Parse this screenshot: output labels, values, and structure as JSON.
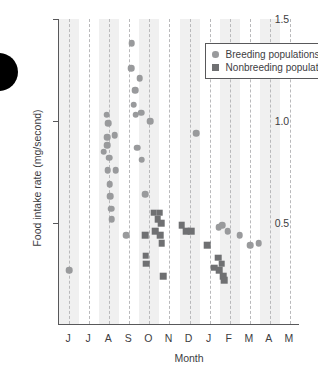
{
  "panel": {
    "marker_shape": "filled-circle",
    "marker_color": "#000000"
  },
  "legend": {
    "entries": [
      {
        "label": "Breeding populations",
        "marker": "circle",
        "color": "#999a9c"
      },
      {
        "label": "Nonbreeding populations",
        "marker": "square",
        "color": "#6f7072"
      }
    ]
  },
  "chart_data": {
    "type": "scatter",
    "title": "",
    "xlabel": "Month",
    "ylabel": "Food intake rate (mg/second)",
    "xlim": [
      0,
      12
    ],
    "ylim": [
      0.0,
      1.5
    ],
    "yticks": [
      0.5,
      1.0,
      1.5
    ],
    "ytick_labels": [
      "0.5",
      "1.0",
      "1.5"
    ],
    "xtick_labels": [
      "J",
      "J",
      "A",
      "S",
      "O",
      "N",
      "D",
      "J",
      "F",
      "M",
      "A",
      "M"
    ],
    "xtick_positions": [
      0.5,
      1.5,
      2.5,
      3.5,
      4.5,
      5.5,
      6.5,
      7.5,
      8.5,
      9.5,
      10.5,
      11.5
    ],
    "grid": "vertical-dashed-at-month-centers",
    "shaded_bands": [
      [
        0.0,
        1.0
      ],
      [
        2.0,
        3.0
      ],
      [
        4.0,
        5.0
      ],
      [
        6.0,
        7.0
      ],
      [
        8.0,
        9.0
      ],
      [
        10.0,
        11.0
      ]
    ],
    "legend_position": "top-right-inside",
    "series": [
      {
        "name": "Breeding populations",
        "marker": "circle",
        "color": "#999a9c",
        "points": [
          [
            0.5,
            0.27
          ],
          [
            2.22,
            0.85
          ],
          [
            2.38,
            1.03
          ],
          [
            2.4,
            0.92
          ],
          [
            2.4,
            0.88
          ],
          [
            2.42,
            0.76
          ],
          [
            2.45,
            0.99
          ],
          [
            2.5,
            0.82
          ],
          [
            2.52,
            0.69
          ],
          [
            2.55,
            0.63
          ],
          [
            2.6,
            0.57
          ],
          [
            2.62,
            0.52
          ],
          [
            2.78,
            0.93
          ],
          [
            2.82,
            0.76
          ],
          [
            3.35,
            0.44
          ],
          [
            3.62,
            1.38
          ],
          [
            3.6,
            1.26
          ],
          [
            3.72,
            1.08
          ],
          [
            3.78,
            1.15
          ],
          [
            3.82,
            1.03
          ],
          [
            3.88,
            0.87
          ],
          [
            4.02,
            1.21
          ],
          [
            4.08,
            1.04
          ],
          [
            4.12,
            0.81
          ],
          [
            4.3,
            0.64
          ],
          [
            4.55,
            1.0
          ],
          [
            6.82,
            0.94
          ],
          [
            7.95,
            0.48
          ],
          [
            8.12,
            0.49
          ],
          [
            8.4,
            0.46
          ],
          [
            9.0,
            0.44
          ],
          [
            9.52,
            0.39
          ],
          [
            9.95,
            0.4
          ]
        ]
      },
      {
        "name": "Nonbreeding populations",
        "marker": "square",
        "color": "#6f7072",
        "points": [
          [
            4.28,
            0.44
          ],
          [
            4.32,
            0.34
          ],
          [
            4.35,
            0.3
          ],
          [
            4.72,
            0.55
          ],
          [
            4.78,
            0.46
          ],
          [
            4.92,
            0.52
          ],
          [
            5.02,
            0.55
          ],
          [
            5.08,
            0.5
          ],
          [
            5.05,
            0.44
          ],
          [
            5.12,
            0.4
          ],
          [
            5.18,
            0.24
          ],
          [
            6.1,
            0.49
          ],
          [
            6.32,
            0.46
          ],
          [
            6.58,
            0.46
          ],
          [
            7.38,
            0.39
          ],
          [
            7.72,
            0.28
          ],
          [
            7.92,
            0.33
          ],
          [
            7.98,
            0.27
          ],
          [
            8.1,
            0.3
          ],
          [
            8.18,
            0.24
          ],
          [
            8.22,
            0.22
          ]
        ]
      }
    ]
  }
}
